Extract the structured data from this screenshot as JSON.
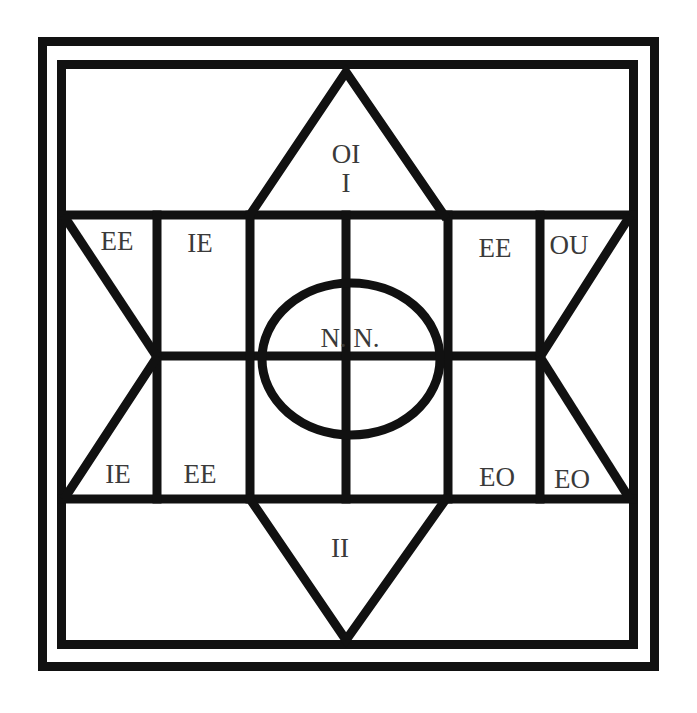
{
  "diagram": {
    "labels": {
      "top_triangle_upper": "OI",
      "top_triangle_lower": "I",
      "upper_left_triangle": "EE",
      "upper_left_box": "IE",
      "upper_right_box": "EE",
      "upper_right_triangle": "OU",
      "center_ellipse": "N. N.",
      "lower_left_triangle": "IE",
      "lower_left_box": "EE",
      "lower_right_box": "EO",
      "lower_right_triangle": "EO",
      "bottom_triangle": "II"
    },
    "colors": {
      "stroke": "#111111",
      "text": "#3a3a3a",
      "background": "#ffffff"
    }
  }
}
